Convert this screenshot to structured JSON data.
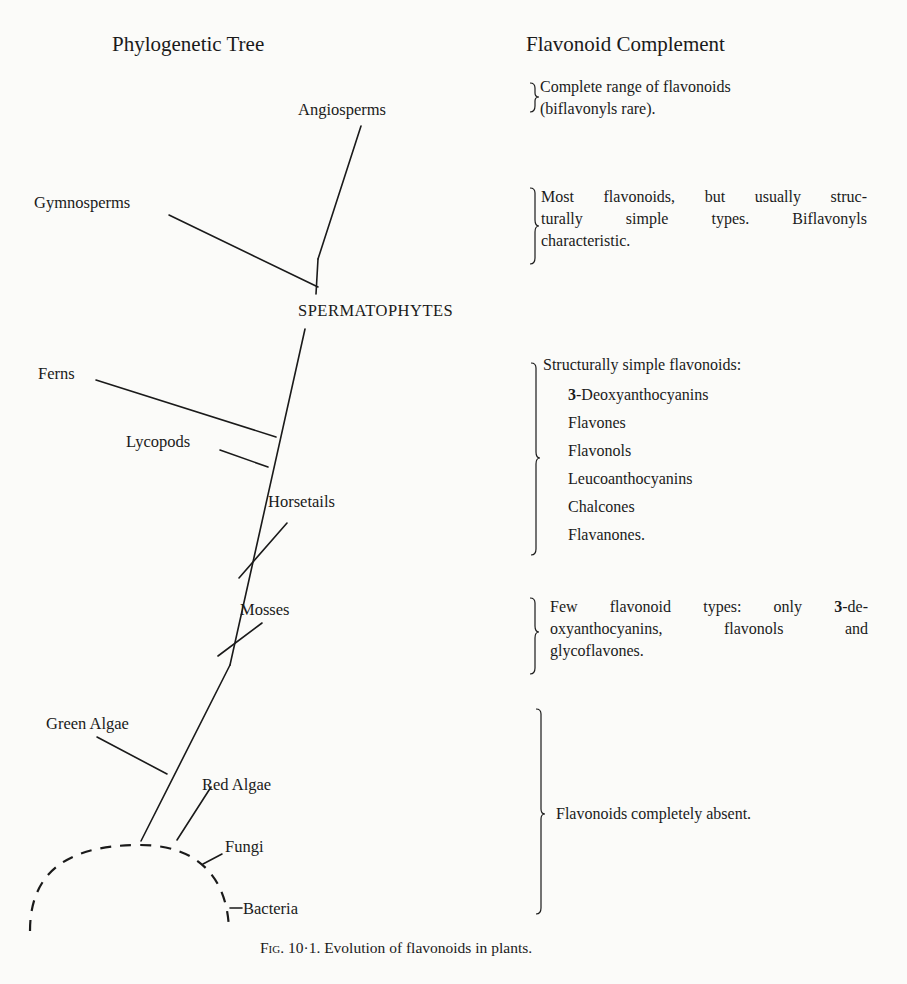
{
  "headings": {
    "left": "Phylogenetic Tree",
    "right": "Flavonoid Complement"
  },
  "taxa": {
    "angiosperms": "Angiosperms",
    "gymnosperms": "Gymnosperms",
    "spermatophytes": "SPERMATOPHYTES",
    "ferns": "Ferns",
    "lycopods": "Lycopods",
    "horsetails": "Horsetails",
    "mosses": "Mosses",
    "green_algae": "Green Algae",
    "red_algae": "Red Algae",
    "fungi": "Fungi",
    "bacteria": "Bacteria"
  },
  "complements": {
    "angiosperms": {
      "lines": [
        "Complete range of flavonoids",
        "(biflavonyls rare)."
      ]
    },
    "gymnosperms": {
      "lines": [
        "Most flavonoids, but usually struc-",
        "turally simple types. Biflavonyls",
        "characteristic."
      ]
    },
    "lower_vascular": {
      "intro": "Structurally simple flavonoids:",
      "items": [
        {
          "prefix": "3",
          "text": "-Deoxyanthocyanins"
        },
        {
          "prefix": "",
          "text": "Flavones"
        },
        {
          "prefix": "",
          "text": "Flavonols"
        },
        {
          "prefix": "",
          "text": "Leucoanthocyanins"
        },
        {
          "prefix": "",
          "text": "Chalcones"
        },
        {
          "prefix": "",
          "text": "Flavanones."
        }
      ]
    },
    "mosses": {
      "line1_pre": "Few flavonoid types: only ",
      "line1_num": "3",
      "line1_post": "-de-",
      "line2": "oxyanthocyanins, flavonols and",
      "line3": "glycoflavones."
    },
    "algae_fungi_bacteria": {
      "text": "Flavonoids completely absent."
    }
  },
  "caption": {
    "label": "Fig.",
    "number": "10·1.",
    "text": "Evolution of flavonoids in plants."
  },
  "colors": {
    "ink": "#1a1a1a",
    "paper": "#fbfbf9"
  }
}
